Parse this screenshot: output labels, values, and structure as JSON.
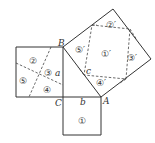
{
  "diagram": {
    "vertices": {
      "A": "A",
      "B": "B",
      "C": "C"
    },
    "sides": {
      "a": "a",
      "b": "b",
      "c": "c"
    },
    "left_square_pieces": [
      "②",
      "③",
      "④",
      "⑤"
    ],
    "bottom_square_pieces": [
      "①"
    ],
    "hypotenuse_square_pieces": [
      "①′",
      "②′",
      "③′",
      "④′",
      "⑤′"
    ],
    "colors": {
      "line": "#333333",
      "background": "#ffffff"
    }
  }
}
